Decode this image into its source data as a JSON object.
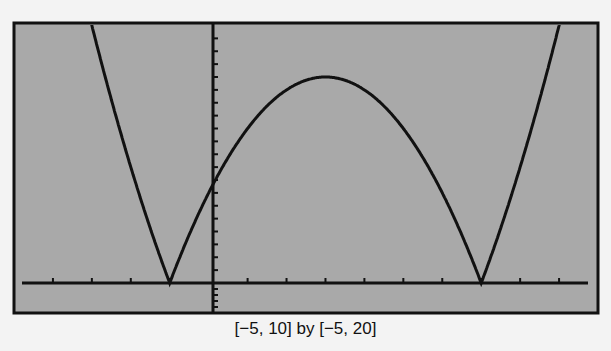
{
  "chart_data": {
    "type": "line",
    "title": "",
    "caption": "[−5, 10] by [−5, 20]",
    "function": "y = |x^2 - 6x - 7|",
    "xlim": [
      -5,
      10
    ],
    "ylim": [
      -5,
      20
    ],
    "xscale": 1,
    "yscale": 1,
    "grid": false,
    "legend": null,
    "key_points": [
      {
        "x": -1,
        "y": 0,
        "label": "left vertex"
      },
      {
        "x": 0,
        "y": 7,
        "label": "y-intercept"
      },
      {
        "x": 3,
        "y": 16,
        "label": "local max"
      },
      {
        "x": 7,
        "y": 0,
        "label": "right vertex"
      }
    ],
    "background_color": "#a9a9a9",
    "line_color": "#111111"
  },
  "plot": {
    "box": {
      "left": 14,
      "top": 23,
      "right": 598,
      "bottom": 313
    },
    "x_axis_pixel_y": 283,
    "y_axis_pixel_x": 213
  },
  "caption": "[−5, 10] by [−5, 20]"
}
